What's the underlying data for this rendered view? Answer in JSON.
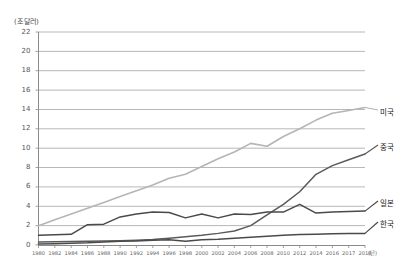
{
  "chart_data": {
    "type": "line",
    "title": "",
    "subtitle": "",
    "ylabel": "(조 달러)",
    "xlabel": "(년)",
    "ylim": [
      0,
      22
    ],
    "yticks": [
      0,
      2,
      4,
      6,
      8,
      10,
      12,
      14,
      16,
      18,
      20,
      22
    ],
    "ytick_labels": [
      "0",
      "2",
      "4",
      "6",
      "8",
      "10",
      "12",
      "14",
      "16",
      "18",
      "20",
      "22"
    ],
    "grid": true,
    "legend_position": "right-inline",
    "x": [
      1980,
      1982,
      1984,
      1986,
      1988,
      1990,
      1992,
      1994,
      1996,
      1998,
      2000,
      2002,
      2004,
      2006,
      2008,
      2010,
      2012,
      2014,
      2016,
      2017,
      2018
    ],
    "xtick_labels": [
      "1980",
      "1982",
      "1984",
      "1986",
      "1988",
      "1990",
      "1992",
      "1994",
      "1996",
      "1998",
      "2000",
      "2002",
      "2004",
      "2006",
      "2008",
      "2010",
      "2012",
      "2014",
      "2016",
      "2017",
      "2018"
    ],
    "series": [
      {
        "name": "미국",
        "color": "#b5b5b5",
        "values": [
          2.0,
          2.6,
          3.2,
          3.8,
          4.4,
          5.0,
          5.6,
          6.2,
          6.9,
          7.3,
          8.1,
          8.9,
          9.6,
          10.5,
          10.2,
          11.2,
          12.0,
          12.9,
          13.6,
          13.9,
          14.2
        ]
      },
      {
        "name": "중국",
        "color": "#5a5a5a",
        "values": [
          0.3,
          0.33,
          0.36,
          0.38,
          0.42,
          0.45,
          0.5,
          0.58,
          0.7,
          0.85,
          1.0,
          1.2,
          1.45,
          2.0,
          3.1,
          4.2,
          5.5,
          7.3,
          8.2,
          8.8,
          9.4
        ]
      },
      {
        "name": "일본",
        "color": "#4a4a4a",
        "values": [
          1.0,
          1.05,
          1.1,
          2.1,
          2.15,
          2.9,
          3.2,
          3.4,
          3.35,
          2.8,
          3.2,
          2.8,
          3.2,
          3.15,
          3.4,
          3.4,
          4.2,
          3.3,
          3.4,
          3.45,
          3.5
        ]
      },
      {
        "name": "한국",
        "color": "#4a4a4a",
        "values": [
          0.1,
          0.14,
          0.18,
          0.22,
          0.3,
          0.38,
          0.42,
          0.5,
          0.55,
          0.4,
          0.55,
          0.6,
          0.7,
          0.8,
          0.9,
          1.0,
          1.08,
          1.12,
          1.16,
          1.18,
          1.2
        ]
      }
    ]
  },
  "labels": {
    "us": "미국",
    "china": "중국",
    "japan": "일본",
    "korea": "한국",
    "y_unit": "(조 달러)",
    "x_unit": "(년)"
  }
}
